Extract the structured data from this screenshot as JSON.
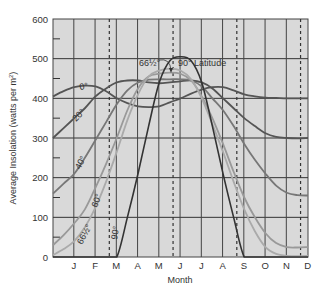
{
  "chart_data": {
    "type": "line",
    "title": "",
    "xlabel": "Month",
    "ylabel": "Average Insolation (watts per m²)",
    "ylim": [
      0,
      600
    ],
    "yticks": [
      0,
      100,
      200,
      300,
      400,
      500,
      600
    ],
    "y_minor_ticks": [
      50,
      150,
      250,
      350,
      450,
      550
    ],
    "grid": true,
    "x_tick_labels": [
      "J",
      "F",
      "M",
      "A",
      "M",
      "J",
      "J",
      "A",
      "S",
      "O",
      "N",
      "D"
    ],
    "solstice_equinox_markers": [
      "Mar equinox",
      "Jun solstice",
      "Sep equinox",
      "Dec solstice"
    ],
    "x": [
      0,
      0.5,
      1,
      1.5,
      2,
      2.5,
      3,
      3.5,
      4,
      4.5,
      5,
      5.5,
      6,
      6.5,
      7,
      7.5,
      8,
      8.5,
      9,
      9.5,
      10,
      10.5,
      11,
      11.5,
      12
    ],
    "x_note": "months elapsed from December solstice (0) to next December solstice (12)",
    "series": [
      {
        "name": "0°",
        "label": "0°",
        "color": "#555555",
        "values": [
          405,
          418,
          428,
          432,
          430,
          418,
          400,
          388,
          380,
          378,
          380,
          390,
          400,
          412,
          422,
          428,
          428,
          420,
          410,
          405,
          402,
          401,
          400,
          400,
          400
        ]
      },
      {
        "name": "20°",
        "label": "20°",
        "color": "#555555",
        "values": [
          300,
          325,
          350,
          375,
          405,
          425,
          440,
          445,
          445,
          440,
          438,
          440,
          443,
          445,
          440,
          425,
          400,
          375,
          350,
          330,
          312,
          303,
          300,
          299,
          300
        ]
      },
      {
        "name": "40°",
        "label": "40°",
        "color": "#777777",
        "values": [
          160,
          185,
          210,
          250,
          295,
          340,
          385,
          420,
          440,
          447,
          448,
          448,
          448,
          445,
          430,
          400,
          370,
          330,
          285,
          245,
          210,
          180,
          162,
          156,
          155
        ]
      },
      {
        "name": "60°",
        "label": "60°",
        "color": "#999999",
        "values": [
          30,
          55,
          85,
          120,
          175,
          235,
          300,
          370,
          425,
          455,
          462,
          465,
          462,
          445,
          405,
          350,
          285,
          215,
          150,
          100,
          60,
          35,
          25,
          24,
          25
        ]
      },
      {
        "name": "66½°",
        "label": "66½°",
        "color": "#aaaaaa",
        "values": [
          5,
          20,
          40,
          75,
          125,
          190,
          265,
          345,
          410,
          455,
          470,
          475,
          470,
          448,
          400,
          335,
          265,
          190,
          120,
          65,
          25,
          8,
          3,
          2,
          3
        ]
      },
      {
        "name": "90°",
        "label": "90°",
        "color": "#333333",
        "values": [
          0,
          0,
          0,
          0,
          0,
          0,
          0,
          100,
          210,
          330,
          440,
          495,
          505,
          495,
          440,
          330,
          210,
          100,
          0,
          0,
          0,
          0,
          0,
          0,
          0
        ]
      }
    ],
    "annotations": [
      {
        "text": "66½°",
        "points_to": "66½° peak"
      },
      {
        "text": "90° Latitude",
        "points_to": "90° peak"
      }
    ]
  },
  "axis": {
    "ylabel": "Average Insolation (watts per m²)",
    "ylabel_main": "Average Insolation (watts per m",
    "ylabel_sup": "2",
    "ylabel_end": ")",
    "xlabel": "Month",
    "yticks": [
      "0",
      "100",
      "200",
      "300",
      "400",
      "500",
      "600"
    ],
    "months": [
      "J",
      "F",
      "M",
      "A",
      "M",
      "J",
      "J",
      "A",
      "S",
      "O",
      "N",
      "D"
    ]
  },
  "annotations": {
    "peak_6612": "66½°",
    "peak_90": "90° Latitude"
  },
  "curve_labels": {
    "l0": "0°",
    "l20": "20°",
    "l40": "40°",
    "l60": "60°",
    "l6612": "66½°",
    "l90": "90°"
  }
}
